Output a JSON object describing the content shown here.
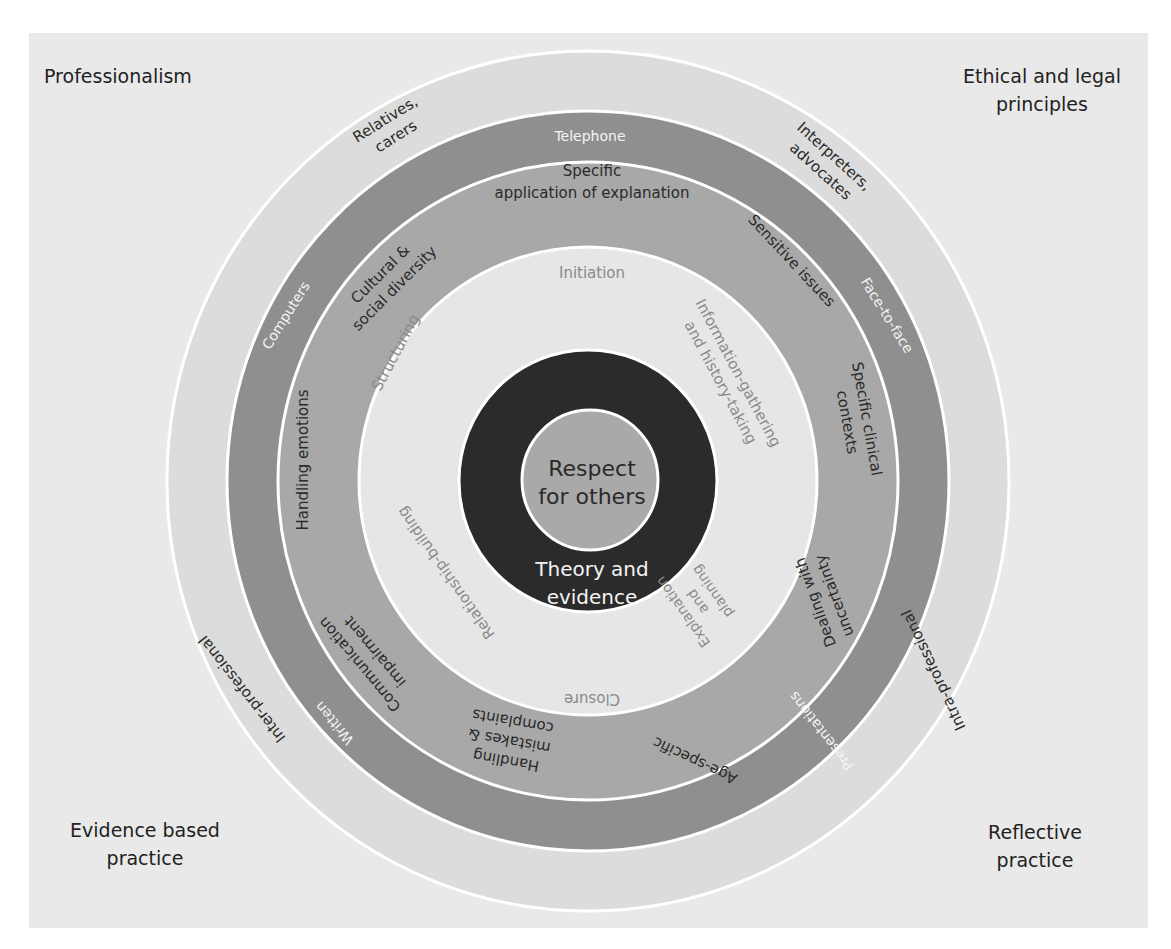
{
  "colors": {
    "background": "#e9e9e9",
    "outer_ring": "#dcdcdc",
    "dark_ring": "#8f8f8f",
    "medium_ring": "#a8a8a8",
    "light_ring": "#e6e6e6",
    "black_ring": "#2b2b2b",
    "core": "#a9a9a9",
    "divider": "#ffffff"
  },
  "corners": {
    "top_left": "Professionalism",
    "top_right": [
      "Ethical and legal",
      "principles"
    ],
    "bottom_left": [
      "Evidence based",
      "practice"
    ],
    "bottom_right": [
      "Reflective",
      "practice"
    ]
  },
  "core": {
    "lines": [
      "Respect",
      "for others"
    ]
  },
  "black_ring": {
    "lines": [
      "Theory and",
      "evidence"
    ]
  },
  "light_ring": {
    "initiation": "Initiation",
    "info_gathering": [
      "Information-gathering",
      "and history-taking"
    ],
    "explanation": [
      "Explanation",
      "and",
      "planning"
    ],
    "closure": "Closure",
    "relationship": "Relationship-building",
    "structuring": "Structuring"
  },
  "medium_ring": {
    "specific_explanation": [
      "Specific",
      "application of explanation"
    ],
    "sensitive": "Sensitive issues",
    "clinical_contexts": [
      "Specific clinical",
      "contexts"
    ],
    "uncertainty": [
      "Dealing with",
      "uncertainty"
    ],
    "age_specific": "Age-specific",
    "mistakes": [
      "Handling",
      "mistakes &",
      "complaints"
    ],
    "comm_impairment": [
      "Communication",
      "impairment"
    ],
    "emotions": "Handling emotions",
    "cultural": [
      "Cultural &",
      "social diversity"
    ]
  },
  "dark_ring": {
    "telephone": "Telephone",
    "face_to_face": "Face-to-face",
    "presentations": "Presentations",
    "written": "Written",
    "computers": "Computers"
  },
  "outer_ring": {
    "relatives": [
      "Relatives,",
      "carers"
    ],
    "interpreters": [
      "Interpreters,",
      "advocates"
    ],
    "intra": "Intra-professional",
    "inter": "Inter-professional"
  }
}
